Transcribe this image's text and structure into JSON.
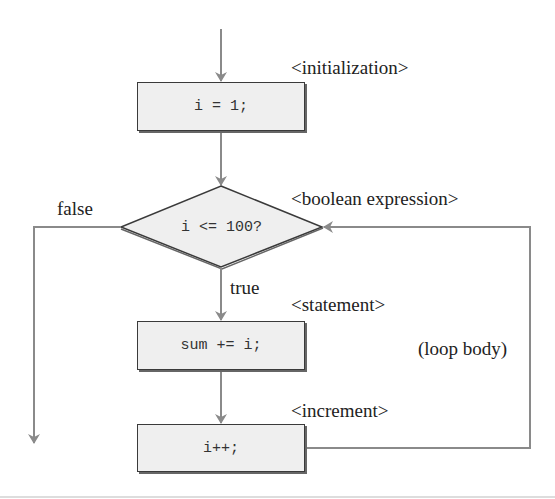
{
  "diagram": {
    "type": "flowchart",
    "colors": {
      "arrow": "#8a8a8a",
      "box_fill": "#efefef",
      "box_border": "#3a3a3a",
      "text": "#222222"
    },
    "nodes": {
      "init": {
        "shape": "rectangle",
        "code": "i = 1;"
      },
      "condition": {
        "shape": "diamond",
        "code": "i <= 100?"
      },
      "statement": {
        "shape": "rectangle",
        "code": "sum += i;"
      },
      "increment": {
        "shape": "rectangle",
        "code": "i++;"
      }
    },
    "annotations": {
      "initialization": "<initialization>",
      "boolean_expression": "<boolean expression>",
      "statement": "<statement>",
      "increment": "<increment>",
      "loop_body": "(loop body)"
    },
    "edge_labels": {
      "false": "false",
      "true": "true"
    },
    "edges": [
      {
        "from": "entry",
        "to": "init"
      },
      {
        "from": "init",
        "to": "condition"
      },
      {
        "from": "condition",
        "to": "statement",
        "label": "true"
      },
      {
        "from": "condition",
        "to": "exit",
        "label": "false"
      },
      {
        "from": "statement",
        "to": "increment"
      },
      {
        "from": "increment",
        "to": "condition"
      }
    ]
  }
}
